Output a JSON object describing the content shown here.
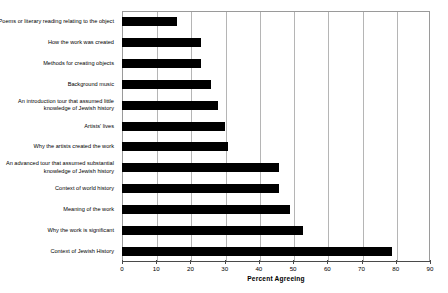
{
  "chart_data": {
    "type": "bar",
    "orientation": "horizontal",
    "title": "",
    "xlabel": "Percent Agreeing",
    "ylabel": "",
    "xlim": [
      0,
      90
    ],
    "xticks": [
      0,
      10,
      20,
      30,
      40,
      50,
      60,
      70,
      80,
      90
    ],
    "grid": true,
    "legend": false,
    "bar_color": "#000000",
    "categories": [
      "Poems or literary reading relating to the object",
      "How the work was created",
      "Methods for creating objects",
      "Background music",
      "An introduction tour that assumed little knowledge of Jewish history",
      "Artists' lives",
      "Why the artists created the work",
      "An advanced tour that assumed substantial knowledge of Jewish history",
      "Context of world history",
      "Meaning of the work",
      "Why the work is significant",
      "Context of Jewish History"
    ],
    "values": [
      16,
      23,
      23,
      26,
      28,
      30,
      31,
      46,
      46,
      49,
      53,
      79
    ]
  },
  "axis": {
    "tick_labels": [
      "0",
      "10",
      "20",
      "30",
      "40",
      "50",
      "60",
      "70",
      "80",
      "90"
    ],
    "x_title": "Percent Agreeing"
  }
}
